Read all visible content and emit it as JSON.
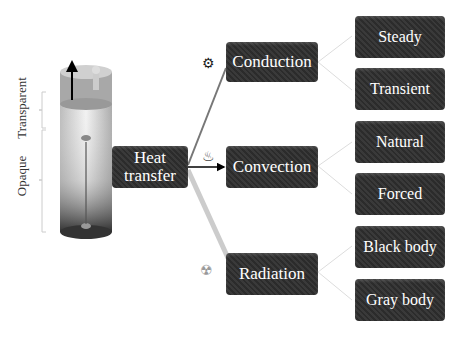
{
  "diagram": {
    "side_labels": {
      "top": "Transparent",
      "bottom": "Opaque"
    },
    "root": {
      "label_line1": "Heat",
      "label_line2": "transfer"
    },
    "modes": [
      {
        "label": "Conduction",
        "icon": "gears-icon",
        "children": [
          "Steady",
          "Transient"
        ]
      },
      {
        "label": "Convection",
        "icon": "heat-waves-icon",
        "children": [
          "Natural",
          "Forced"
        ]
      },
      {
        "label": "Radiation",
        "icon": "radiation-icon",
        "children": [
          "Black body",
          "Gray body"
        ]
      }
    ]
  }
}
